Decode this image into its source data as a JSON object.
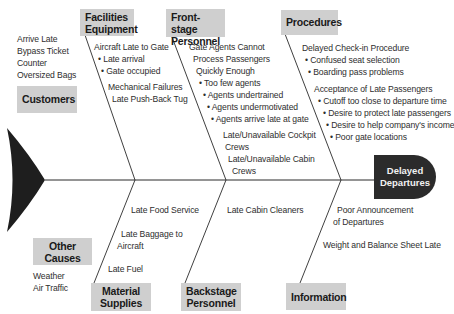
{
  "effect": {
    "line1": "Delayed",
    "line2": "Departures"
  },
  "categories": {
    "facilities": {
      "line1": "Facilities",
      "line2": "Equipment",
      "causes": [
        "Aircraft Late to Gate",
        "• Late arrival",
        "• Gate occupied",
        "Mechanical Failures",
        "Late Push-Back Tug"
      ]
    },
    "frontstage": {
      "line1": "Front-stage",
      "line2": "Personnel",
      "causes": [
        "Gate Agents Cannot",
        "Process Passengers",
        "Quickly Enough",
        "• Too few agents",
        "• Agents undertrained",
        "• Agents undermotivated",
        "• Agents arrive late at gate",
        "Late/Unavailable Cockpit",
        "Crews",
        "Late/Unavailable Cabin",
        "Crews"
      ]
    },
    "procedures": {
      "line1": "Procedures",
      "causes": [
        "Delayed Check-in Procedure",
        "• Confused seat selection",
        "• Boarding pass problems",
        "Acceptance of Late Passengers",
        "• Cutoff too close to departure time",
        "• Desire to protect late passengers",
        "• Desire to help company's income",
        "• Poor gate locations"
      ]
    },
    "customers": {
      "line1": "Customers",
      "causes": [
        "Arrive Late",
        "Bypass Ticket",
        "Counter",
        "Oversized Bags"
      ]
    },
    "other": {
      "line1": "Other",
      "line2": "Causes",
      "causes": [
        "Weather",
        "Air Traffic"
      ]
    },
    "material": {
      "line1": "Material",
      "line2": "Supplies",
      "causes": [
        "Late Food Service",
        "Late Baggage to",
        "Aircraft",
        "Late Fuel"
      ]
    },
    "backstage": {
      "line1": "Backstage",
      "line2": "Personnel",
      "causes": [
        "Late Cabin Cleaners"
      ]
    },
    "information": {
      "line1": "Information",
      "causes": [
        "Poor Announcement",
        "of Departures",
        "Weight and Balance Sheet Late"
      ]
    }
  },
  "colors": {
    "category_box": "#cfcfcf",
    "head": "#2b2b2b",
    "lines": "#2a2a2a"
  }
}
